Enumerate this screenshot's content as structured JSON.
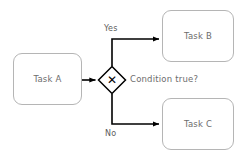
{
  "diagram": {
    "type": "bpmn-flowchart",
    "background_color": "#ffffff",
    "nodes": {
      "task_a": {
        "label": "Task A",
        "shape": "rounded-rectangle",
        "border_color": "#b5b5b5",
        "text_color": "#6d6d6d"
      },
      "task_b": {
        "label": "Task B",
        "shape": "rounded-rectangle",
        "border_color": "#b5b5b5",
        "text_color": "#6d6d6d"
      },
      "task_c": {
        "label": "Task C",
        "shape": "rounded-rectangle",
        "border_color": "#b5b5b5",
        "text_color": "#6d6d6d"
      },
      "gateway": {
        "glyph": "✕",
        "glyph_name": "exclusive-gateway-x",
        "shape": "diamond",
        "border_color": "#000000",
        "fill_color": "#ffffff",
        "annotation": "Condition true?"
      }
    },
    "edges": [
      {
        "name": "task-a-to-gateway",
        "from": "task_a",
        "to": "gateway",
        "label": ""
      },
      {
        "name": "gateway-to-task-b",
        "from": "gateway",
        "to": "task_b",
        "label": "Yes"
      },
      {
        "name": "gateway-to-task-c",
        "from": "gateway",
        "to": "task_c",
        "label": "No"
      }
    ],
    "edge_color": "#000000"
  }
}
